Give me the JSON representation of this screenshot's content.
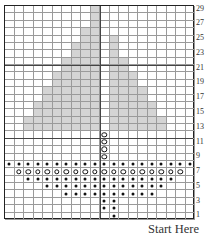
{
  "chart": {
    "columns": 20,
    "rows": 29,
    "row_number_labels": [
      "29",
      "27",
      "25",
      "23",
      "21",
      "19",
      "17",
      "15",
      "13",
      "11",
      "9",
      "7",
      "5",
      "3",
      "1"
    ],
    "colors": {
      "shaded": "#d4d4d4",
      "grid": "#9a9a9a",
      "border": "#222222"
    },
    "legend_symbols": {
      "dot": "filled-dot-stitch",
      "ring": "open-circle-stitch",
      "shaded": "contrast-color-stitch"
    },
    "shaded_rows": [
      {
        "row": 29,
        "ranges": [
          [
            10,
            10
          ]
        ]
      },
      {
        "row": 28,
        "ranges": [
          [
            10,
            10
          ]
        ]
      },
      {
        "row": 27,
        "ranges": [
          [
            10,
            10
          ]
        ]
      },
      {
        "row": 26,
        "ranges": [
          [
            9,
            10
          ]
        ]
      },
      {
        "row": 25,
        "ranges": [
          [
            9,
            10
          ],
          [
            12,
            12
          ]
        ]
      },
      {
        "row": 24,
        "ranges": [
          [
            8,
            10
          ],
          [
            12,
            12
          ]
        ]
      },
      {
        "row": 23,
        "ranges": [
          [
            8,
            10
          ],
          [
            12,
            12
          ]
        ]
      },
      {
        "row": 22,
        "ranges": [
          [
            7,
            10
          ],
          [
            12,
            13
          ]
        ]
      },
      {
        "row": 21,
        "ranges": [
          [
            7,
            10
          ],
          [
            12,
            13
          ]
        ]
      },
      {
        "row": 20,
        "ranges": [
          [
            6,
            10
          ],
          [
            12,
            14
          ]
        ]
      },
      {
        "row": 19,
        "ranges": [
          [
            6,
            10
          ],
          [
            12,
            14
          ]
        ]
      },
      {
        "row": 18,
        "ranges": [
          [
            5,
            10
          ],
          [
            12,
            15
          ]
        ]
      },
      {
        "row": 17,
        "ranges": [
          [
            5,
            10
          ],
          [
            12,
            15
          ]
        ]
      },
      {
        "row": 16,
        "ranges": [
          [
            4,
            10
          ],
          [
            12,
            16
          ]
        ]
      },
      {
        "row": 15,
        "ranges": [
          [
            4,
            10
          ],
          [
            12,
            16
          ]
        ]
      },
      {
        "row": 14,
        "ranges": [
          [
            3,
            10
          ],
          [
            12,
            17
          ]
        ]
      },
      {
        "row": 13,
        "ranges": [
          [
            3,
            10
          ],
          [
            12,
            17
          ]
        ]
      }
    ],
    "symbol_rows": [
      {
        "row": 12,
        "type": "ring",
        "ranges": [
          [
            11,
            11
          ]
        ]
      },
      {
        "row": 11,
        "type": "ring",
        "ranges": [
          [
            11,
            11
          ]
        ]
      },
      {
        "row": 10,
        "type": "ring",
        "ranges": [
          [
            11,
            11
          ]
        ]
      },
      {
        "row": 9,
        "type": "ring",
        "ranges": [
          [
            11,
            11
          ]
        ]
      },
      {
        "row": 8,
        "type": "dot",
        "ranges": [
          [
            1,
            20
          ]
        ]
      },
      {
        "row": 7,
        "type": "ring",
        "ranges": [
          [
            2,
            19
          ]
        ]
      },
      {
        "row": 6,
        "type": "dot",
        "ranges": [
          [
            3,
            18
          ]
        ]
      },
      {
        "row": 5,
        "type": "dot",
        "ranges": [
          [
            5,
            17
          ]
        ]
      },
      {
        "row": 4,
        "type": "dot",
        "ranges": [
          [
            7,
            16
          ]
        ]
      },
      {
        "row": 3,
        "type": "dot",
        "ranges": [
          [
            11,
            12
          ]
        ]
      },
      {
        "row": 2,
        "type": "dot",
        "ranges": [
          [
            11,
            12
          ]
        ]
      },
      {
        "row": 1,
        "type": "dot",
        "ranges": [
          [
            12,
            12
          ]
        ]
      }
    ],
    "guide_lines": {
      "vertical_after_col": 10,
      "horizontal_above_rows": [
        21,
        11
      ]
    }
  },
  "caption": "Start Here"
}
